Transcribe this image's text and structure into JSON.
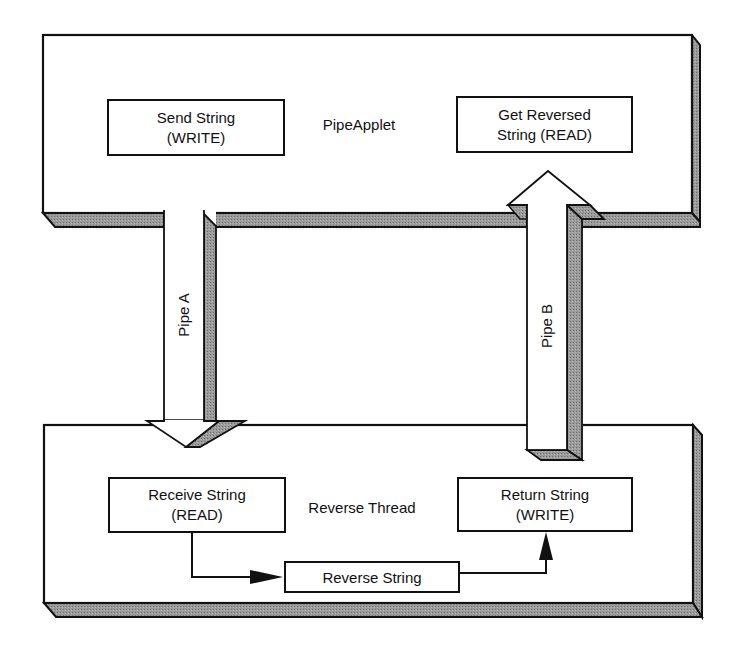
{
  "diagram": {
    "colors": {
      "stroke": "#111111",
      "shadow": "#8e8e8e",
      "face": "#ffffff"
    },
    "top_container": {
      "label": "PipeApplet",
      "boxes": [
        {
          "id": "send",
          "line1": "Send String",
          "line2": "(WRITE)"
        },
        {
          "id": "get",
          "line1": "Get Reversed",
          "line2": "String (READ)"
        }
      ]
    },
    "bottom_container": {
      "label": "Reverse Thread",
      "boxes": [
        {
          "id": "receive",
          "line1": "Receive String",
          "line2": "(READ)"
        },
        {
          "id": "return",
          "line1": "Return String",
          "line2": "(WRITE)"
        },
        {
          "id": "reverse",
          "line1": "Reverse String"
        }
      ]
    },
    "pipes": [
      {
        "id": "pipe-a",
        "label": "Pipe A",
        "direction": "down",
        "from": "Send String (WRITE)",
        "to": "Receive String (READ)"
      },
      {
        "id": "pipe-b",
        "label": "Pipe B",
        "direction": "up",
        "from": "Return String (WRITE)",
        "to": "Get Reversed String (READ)"
      }
    ],
    "connectors": [
      {
        "from": "Receive String",
        "to": "Reverse String"
      },
      {
        "from": "Reverse String",
        "to": "Return String"
      }
    ]
  }
}
